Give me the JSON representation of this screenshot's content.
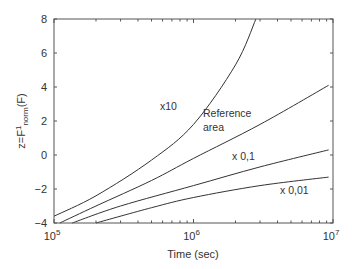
{
  "chart_data": {
    "type": "line",
    "title": "",
    "xlabel": "Time (sec)",
    "ylabel": "z=F¹norm(F)",
    "ylabel_parts": {
      "prefix": "z=F",
      "sup": "1",
      "sub": "norm",
      "suffix": "(F)"
    },
    "xscale": "log",
    "xlim": [
      100000,
      10000000
    ],
    "ylim": [
      -4,
      8
    ],
    "x_ticks": [
      {
        "base": "10",
        "exp": "5"
      },
      {
        "base": "10",
        "exp": "6"
      },
      {
        "base": "10",
        "exp": "7"
      }
    ],
    "y_ticks": [
      "-4",
      "-2",
      "0",
      "2",
      "4",
      "6",
      "8"
    ],
    "grid": false,
    "legend": null,
    "series": [
      {
        "name": "x10",
        "x": [
          100000,
          200000,
          500000,
          1000000,
          2000000,
          2800000
        ],
        "y": [
          -3.6,
          -2.4,
          -0.3,
          1.8,
          5.3,
          8.0
        ]
      },
      {
        "name": "Reference area",
        "x": [
          110000,
          200000,
          500000,
          1000000,
          3000000,
          9300000
        ],
        "y": [
          -4.0,
          -3.0,
          -1.5,
          -0.2,
          1.8,
          4.1
        ]
      },
      {
        "name": "x 0,1",
        "x": [
          135000,
          300000,
          1000000,
          3000000,
          9300000
        ],
        "y": [
          -4.0,
          -3.0,
          -1.8,
          -0.7,
          0.3
        ]
      },
      {
        "name": "x 0,01",
        "x": [
          200000,
          500000,
          1000000,
          3000000,
          9300000
        ],
        "y": [
          -4.0,
          -3.1,
          -2.5,
          -1.8,
          -1.3
        ]
      }
    ],
    "annotations": [
      {
        "text": "x10",
        "x_px": 160,
        "y_px": 110
      },
      {
        "text": "Reference",
        "x_px": 203,
        "y_px": 117
      },
      {
        "text": "area",
        "x_px": 203,
        "y_px": 131
      },
      {
        "text": "x 0,1",
        "x_px": 232,
        "y_px": 160
      },
      {
        "text": "x 0,01",
        "x_px": 280,
        "y_px": 194
      }
    ]
  }
}
